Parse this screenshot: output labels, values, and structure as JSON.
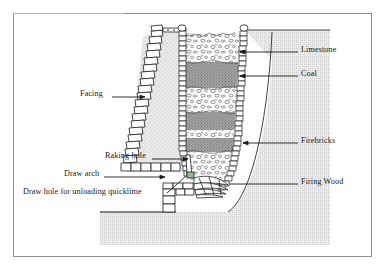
{
  "figure": {
    "background_color": "#ffffff",
    "frame_color": "#8d8d8d"
  },
  "colors": {
    "ground_fill": "#e8e8e8",
    "ground_stipple": "#7a7a7a",
    "coal_fill": "#9a9a9a",
    "limestone_fill": "#fbfbfb",
    "stone_outline": "#1a1a1a",
    "firebrick_fill": "#ffffff",
    "draw_arch_highlight": "#8fbf8f",
    "leader_line": "#1a1a1a"
  },
  "labels": {
    "right": [
      {
        "id": "limestone",
        "text": "Limestone",
        "x": 301,
        "y": 49,
        "leader_from_x": 298,
        "leader_to_x": 237,
        "leader_y": 52
      },
      {
        "id": "coal",
        "text": "Coal",
        "x": 301,
        "y": 73,
        "leader_from_x": 298,
        "leader_to_x": 237,
        "leader_y": 76
      },
      {
        "id": "firebricks",
        "text": "Firebricks",
        "x": 301,
        "y": 140,
        "leader_from_x": 298,
        "leader_to_x": 240,
        "leader_y": 143
      },
      {
        "id": "firing-wood",
        "text": "Firing Wood",
        "x": 301,
        "y": 181,
        "leader_from_x": 298,
        "leader_to_x": 228,
        "leader_y": 184
      }
    ],
    "left": [
      {
        "id": "facing",
        "text": "Facing",
        "x": 80,
        "y": 93,
        "leader_from_x": 112,
        "leader_to_x": 143,
        "leader_y": 97
      },
      {
        "id": "raking-hole",
        "text": "Raking hole",
        "x": 105,
        "y": 155,
        "leader_from_x": 152,
        "leader_to_x": 186,
        "leader_y": 159
      },
      {
        "id": "draw-arch",
        "text": "Draw arch",
        "x": 64,
        "y": 173,
        "leader_from_x": 104,
        "leader_to_x": 164,
        "leader_y": 177
      },
      {
        "id": "draw-hole",
        "text": "Draw hole for unloading quicklime",
        "x": 23,
        "y": 191,
        "leader_from_x": 167,
        "leader_to_x": 190,
        "leader_y": 195
      }
    ]
  },
  "kiln": {
    "top_y": 30,
    "bottom_y": 200,
    "ground_line_y": 212,
    "charge_layers": [
      {
        "material": "Limestone",
        "top": 32,
        "bottom": 62
      },
      {
        "material": "Coal",
        "top": 62,
        "bottom": 88
      },
      {
        "material": "Limestone",
        "top": 88,
        "bottom": 112
      },
      {
        "material": "Coal",
        "top": 112,
        "bottom": 130
      },
      {
        "material": "Limestone",
        "top": 130,
        "bottom": 138
      },
      {
        "material": "Coal",
        "top": 138,
        "bottom": 152
      },
      {
        "material": "Limestone",
        "top": 152,
        "bottom": 186
      }
    ],
    "parts": [
      "Facing",
      "Firebricks",
      "Limestone",
      "Coal",
      "Raking hole",
      "Draw arch",
      "Draw hole for unloading quicklime",
      "Firing Wood"
    ]
  }
}
